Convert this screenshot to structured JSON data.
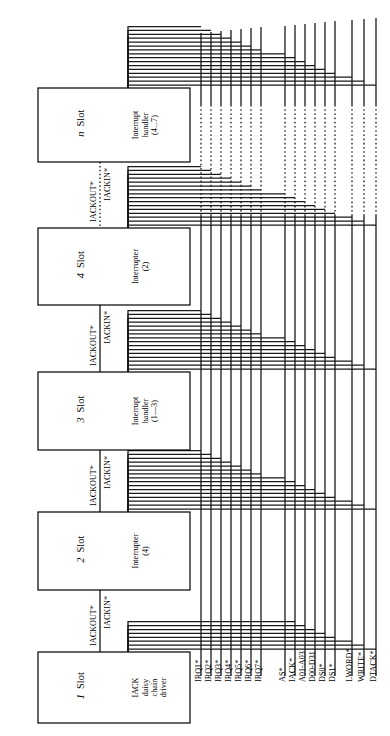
{
  "diagram": {
    "orientation": "rotated-90",
    "slots": [
      {
        "id": "slot-n",
        "slot_word": "Slot",
        "slot_number": "n",
        "role_lines": [
          "Interrupt",
          "handler",
          "(4...7)"
        ],
        "box": {
          "x": 38,
          "y": 88,
          "w": 152,
          "h": 74
        }
      },
      {
        "id": "slot-4",
        "slot_word": "Slot",
        "slot_number": "4",
        "role_lines": [
          "Interrupter",
          "(2)"
        ],
        "box": {
          "x": 38,
          "y": 228,
          "w": 152,
          "h": 77
        }
      },
      {
        "id": "slot-3",
        "slot_word": "Slot",
        "slot_number": "3",
        "role_lines": [
          "Interrupt",
          "handler",
          "(1—3)"
        ],
        "box": {
          "x": 38,
          "y": 372,
          "w": 152,
          "h": 78
        }
      },
      {
        "id": "slot-2",
        "slot_word": "Slot",
        "slot_number": "2",
        "role_lines": [
          "Interrupter",
          "(4)"
        ],
        "box": {
          "x": 38,
          "y": 512,
          "w": 152,
          "h": 78
        }
      },
      {
        "id": "slot-1",
        "slot_word": "Slot",
        "slot_number": "1",
        "role_lines": [
          "IACK",
          "daisy",
          "chain",
          "driver"
        ],
        "box": {
          "x": 38,
          "y": 652,
          "w": 152,
          "h": 71
        }
      }
    ],
    "chain_labels": {
      "out": "IACKOUT*",
      "in": "IACKIN*"
    },
    "chain_segments": [
      {
        "id": "chain-n-4",
        "from": "slot-4",
        "to": "slot-n",
        "y_top": 162,
        "y_bottom": 228,
        "style": "dotted"
      },
      {
        "id": "chain-4-3",
        "from": "slot-3",
        "to": "slot-4",
        "y_top": 305,
        "y_bottom": 372,
        "style": "solid"
      },
      {
        "id": "chain-3-2",
        "from": "slot-2",
        "to": "slot-3",
        "y_top": 450,
        "y_bottom": 512,
        "style": "solid"
      },
      {
        "id": "chain-2-1",
        "from": "slot-1",
        "to": "slot-2",
        "y_top": 590,
        "y_bottom": 652,
        "style": "solid"
      }
    ],
    "bus_signals": [
      {
        "label": "IRQ1*",
        "x": 201
      },
      {
        "label": "IRQ2*",
        "x": 211
      },
      {
        "label": "IRQ3*",
        "x": 221
      },
      {
        "label": "IRQ4*",
        "x": 231
      },
      {
        "label": "IRQ5*",
        "x": 241
      },
      {
        "label": "IRQ6*",
        "x": 251
      },
      {
        "label": "IRQ7*",
        "x": 261
      },
      {
        "label": "AS*",
        "x": 285
      },
      {
        "label": "IACK*",
        "x": 295
      },
      {
        "label": "A01-A03",
        "x": 305
      },
      {
        "label": "D00-D31",
        "x": 315
      },
      {
        "label": "DS0*",
        "x": 325
      },
      {
        "label": "DS1*",
        "x": 335
      },
      {
        "label": "LWORD*",
        "x": 352
      },
      {
        "label": "WRITE*",
        "x": 364
      },
      {
        "label": "DTACK*",
        "x": 376
      }
    ],
    "bus_dotted_gap": {
      "y_top": 105,
      "y_bottom": 215
    },
    "colors": {
      "line": "#1a1a1a",
      "box_stroke": "#000000",
      "background": "#ffffff"
    }
  }
}
